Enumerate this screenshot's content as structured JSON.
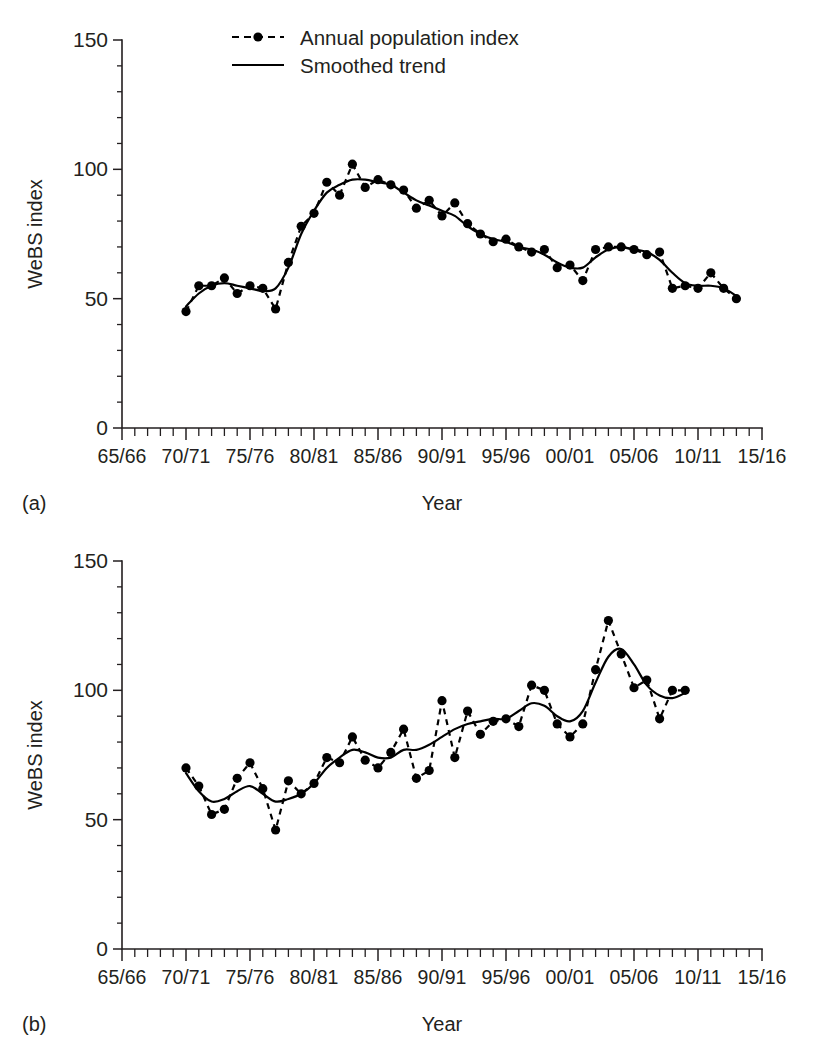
{
  "figure": {
    "panels": [
      {
        "letter": "(a)",
        "y_axis_label": "WeBS index",
        "x_axis_label": "Year"
      },
      {
        "letter": "(b)",
        "y_axis_label": "WeBS index",
        "x_axis_label": "Year"
      }
    ],
    "legend": {
      "items": [
        {
          "label": "Annual population index",
          "style": "dashed-with-marker"
        },
        {
          "label": "Smoothed trend",
          "style": "solid-line"
        }
      ]
    },
    "colors": {
      "ink": "#231f20",
      "series": "#000000",
      "background": "#ffffff"
    }
  },
  "chart_data": [
    {
      "type": "line",
      "title": "",
      "panel": "(a)",
      "xlabel": "Year",
      "ylabel": "WeBS index",
      "ylim": [
        0,
        150
      ],
      "yticks": [
        0,
        50,
        100,
        150
      ],
      "ytick_labels": [
        "0",
        "50",
        "100",
        "150"
      ],
      "xlim": [
        "65/66",
        "15/16"
      ],
      "xticks": [
        "65/66",
        "70/71",
        "75/76",
        "80/81",
        "85/86",
        "90/91",
        "95/96",
        "00/01",
        "05/06",
        "10/11",
        "15/16"
      ],
      "xtick_labels": [
        "65/66",
        "70/71",
        "75/76",
        "80/81",
        "85/86",
        "90/91",
        "95/96",
        "00/01",
        "05/06",
        "10/11",
        "15/16"
      ],
      "grid": false,
      "legend_position": "top-center",
      "x": [
        "70/71",
        "71/72",
        "72/73",
        "73/74",
        "74/75",
        "75/76",
        "76/77",
        "77/78",
        "78/79",
        "79/80",
        "80/81",
        "81/82",
        "82/83",
        "83/84",
        "84/85",
        "85/86",
        "86/87",
        "87/88",
        "88/89",
        "89/90",
        "90/91",
        "91/92",
        "92/93",
        "93/94",
        "94/95",
        "95/96",
        "96/97",
        "97/98",
        "98/99",
        "99/00",
        "00/01",
        "01/02",
        "02/03",
        "03/04",
        "04/05",
        "05/06",
        "06/07",
        "07/08",
        "08/09",
        "09/10",
        "10/11",
        "11/12",
        "12/13",
        "13/14"
      ],
      "series": [
        {
          "name": "Annual population index",
          "style": "dashed-with-marker",
          "values": [
            45,
            55,
            55,
            58,
            52,
            55,
            54,
            46,
            64,
            78,
            83,
            95,
            90,
            102,
            93,
            96,
            94,
            92,
            85,
            88,
            82,
            87,
            79,
            75,
            72,
            73,
            70,
            68,
            69,
            62,
            63,
            57,
            69,
            70,
            70,
            69,
            67,
            68,
            54,
            55,
            54,
            60,
            54,
            50
          ]
        },
        {
          "name": "Smoothed trend",
          "style": "solid-line",
          "values": [
            47,
            52,
            55,
            56,
            55,
            54,
            53,
            54,
            62,
            75,
            84,
            91,
            94,
            96,
            96,
            95,
            94,
            91,
            88,
            86,
            84,
            82,
            78,
            75,
            73,
            72,
            70,
            69,
            67,
            64,
            62,
            62,
            66,
            69,
            70,
            69,
            68,
            65,
            60,
            56,
            55,
            55,
            54,
            51
          ]
        }
      ]
    },
    {
      "type": "line",
      "title": "",
      "panel": "(b)",
      "xlabel": "Year",
      "ylabel": "WeBS index",
      "ylim": [
        0,
        150
      ],
      "yticks": [
        0,
        50,
        100,
        150
      ],
      "ytick_labels": [
        "0",
        "50",
        "100",
        "150"
      ],
      "xlim": [
        "65/66",
        "15/16"
      ],
      "xticks": [
        "65/66",
        "70/71",
        "75/76",
        "80/81",
        "85/86",
        "90/91",
        "95/96",
        "00/01",
        "05/06",
        "10/11",
        "15/16"
      ],
      "xtick_labels": [
        "65/66",
        "70/71",
        "75/76",
        "80/81",
        "85/86",
        "90/91",
        "95/96",
        "00/01",
        "05/06",
        "10/11",
        "15/16"
      ],
      "grid": false,
      "legend_position": "none",
      "x": [
        "70/71",
        "71/72",
        "72/73",
        "73/74",
        "74/75",
        "75/76",
        "76/77",
        "77/78",
        "78/79",
        "79/80",
        "80/81",
        "81/82",
        "82/83",
        "83/84",
        "84/85",
        "85/86",
        "86/87",
        "87/88",
        "88/89",
        "89/90",
        "90/91",
        "91/92",
        "92/93",
        "93/94",
        "94/95",
        "95/96",
        "96/97",
        "97/98",
        "98/99",
        "99/00",
        "00/01",
        "01/02",
        "02/03",
        "03/04",
        "04/05",
        "05/06",
        "06/07",
        "07/08",
        "08/09",
        "09/10",
        "10/11",
        "11/12",
        "12/13"
      ],
      "series": [
        {
          "name": "Annual population index",
          "style": "dashed-with-marker",
          "values": [
            70,
            63,
            52,
            54,
            66,
            72,
            62,
            46,
            65,
            60,
            64,
            74,
            72,
            82,
            73,
            70,
            76,
            85,
            66,
            69,
            96,
            74,
            92,
            83,
            88,
            89,
            86,
            102,
            100,
            87,
            82,
            87,
            108,
            127,
            114,
            101,
            104,
            89,
            100,
            100
          ]
        },
        {
          "name": "Smoothed trend",
          "style": "solid-line",
          "values": [
            68,
            61,
            57,
            58,
            61,
            63,
            60,
            57,
            58,
            60,
            64,
            70,
            74,
            77,
            76,
            74,
            74,
            77,
            77,
            79,
            82,
            85,
            87,
            88,
            89,
            89,
            92,
            95,
            94,
            90,
            88,
            92,
            103,
            113,
            116,
            110,
            102,
            98,
            97,
            99
          ]
        }
      ]
    }
  ]
}
